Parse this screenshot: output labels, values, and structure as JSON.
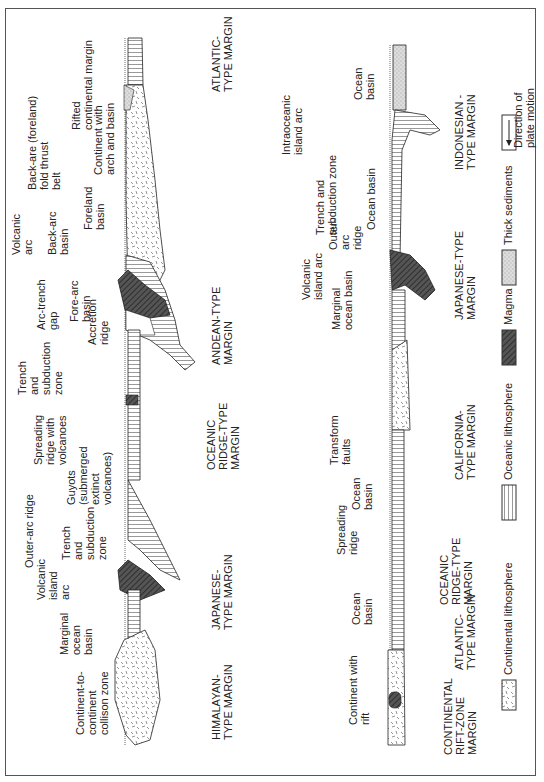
{
  "figure": {
    "orientation": "rotated 90° counter-clockwise",
    "panels": [
      {
        "id": "left",
        "margins": [
          {
            "label": [
              "ATLANTIC-",
              "TYPE MARGIN"
            ]
          },
          {
            "label": [
              "ANDEAN-TYPE",
              "MARGIN"
            ]
          },
          {
            "label": [
              "OCEANIC",
              "RIDGE-TYPE",
              "MARGIN"
            ]
          },
          {
            "label": [
              "JAPANESE-",
              "TYPE MARGIN"
            ]
          },
          {
            "label": [
              "HIMALAYAN-",
              "TYPE MARGIN"
            ]
          }
        ],
        "annotations": [
          [
            "Rifted",
            "continental margin"
          ],
          [
            "Continent with",
            "arch and basin"
          ],
          [
            "Back-are (foreland)",
            "fold thrust",
            "belt"
          ],
          [
            "Foreland",
            "basin"
          ],
          [
            "Volcanic",
            "arc"
          ],
          [
            "Back-arc",
            "basin"
          ],
          [
            "Arc-trench",
            "gap"
          ],
          [
            "Fore-arc",
            "basin"
          ],
          [
            "Accretion",
            "ridge"
          ],
          [
            "Trench",
            "and",
            "subduction",
            "zone"
          ],
          [
            "Spreading",
            "ridge with",
            "volcanoes"
          ],
          [
            "Guyots",
            "(submerged",
            "extinct",
            "volcanoes)"
          ],
          [
            "Outer-arc ridge"
          ],
          [
            "Trench",
            "and",
            "subduction",
            "zone"
          ],
          [
            "Volcanic",
            "island",
            "arc"
          ],
          [
            "Marginal",
            "ocean",
            "basin"
          ],
          [
            "Continent-to-",
            "continent",
            "collison zone"
          ]
        ]
      },
      {
        "id": "right",
        "margins": [
          {
            "label": [
              "INDONESIAN -",
              "TYPE MARGIN"
            ]
          },
          {
            "label": [
              "JAPANESE-TYPE",
              "MARGIN"
            ]
          },
          {
            "label": [
              "CALIFORNIA-",
              "TYPE MARGIN"
            ]
          },
          {
            "label": [
              "OCEANIC",
              "RIDGE-TYPE",
              "MARGIN"
            ]
          },
          {
            "label": [
              "ATLANTIC-",
              "TYPE MARGIN"
            ]
          },
          {
            "label": [
              "CONTINENTAL",
              "RIFT-ZONE",
              "MARGIN"
            ]
          }
        ],
        "annotations": [
          [
            "Ocean",
            "basin"
          ],
          [
            "Intraoceanic",
            "island arc"
          ],
          [
            "Trench and",
            "subduction zone"
          ],
          [
            "Ocean  basin"
          ],
          [
            "Outer-",
            "arc",
            "ridge"
          ],
          [
            "Volcanic",
            "island arc"
          ],
          [
            "Marginal",
            "ocean basin"
          ],
          [
            "Transform",
            "faults"
          ],
          [
            "Ocean",
            "basin"
          ],
          [
            "Spreading",
            "ridge"
          ],
          [
            "Ocean",
            "basin"
          ],
          [
            "Continent with",
            "rift"
          ]
        ]
      }
    ],
    "legend": [
      {
        "icon": "direction-arrow-icon",
        "label": [
          "Direction of",
          "plate motion"
        ]
      },
      {
        "icon": "thick-sediments-swatch",
        "label": [
          "Thick sediments"
        ]
      },
      {
        "icon": "magma-swatch",
        "label": [
          "Magma"
        ]
      },
      {
        "icon": "oceanic-lithosphere-swatch",
        "label": [
          "Oceanic lithosphere"
        ]
      },
      {
        "icon": "continental-lithosphere-swatch",
        "label": [
          "Continental lithosphere"
        ]
      }
    ]
  }
}
